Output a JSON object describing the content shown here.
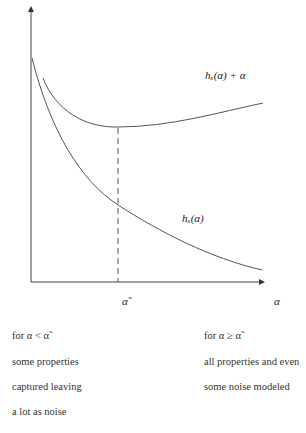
{
  "diagram": {
    "labels": {
      "upper_curve": "hₓ(α) + α",
      "lower_curve": "hₓ(α)",
      "x_marker": "α̃",
      "x_axis": "α"
    },
    "left_note": {
      "line1": "for α < α̃",
      "line2": "some properties",
      "line3": "captured leaving",
      "line4": "a lot as noise"
    },
    "right_note": {
      "line1": "for α ≥ α̃",
      "line2": "all properties and even",
      "line3": "some noise modeled"
    },
    "colors": {
      "axis": "#333333",
      "curve": "#555555"
    }
  }
}
